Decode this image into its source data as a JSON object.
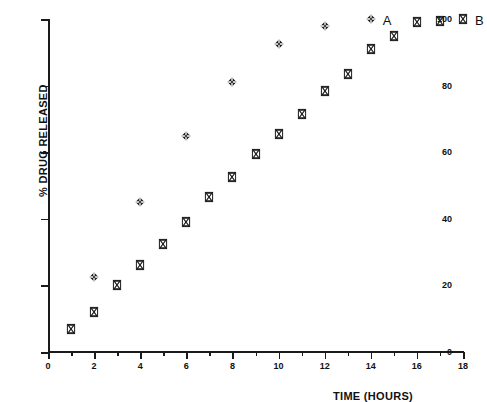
{
  "chart_data": {
    "type": "scatter",
    "title": "",
    "xlabel": "TIME (HOURS)",
    "ylabel": "% DRUG RELEASED",
    "xlim": [
      0,
      18
    ],
    "ylim": [
      0,
      100
    ],
    "x_ticks": [
      0,
      2,
      4,
      6,
      8,
      10,
      12,
      14,
      16,
      18
    ],
    "x_tick_labels": [
      "0",
      "2",
      "4",
      "6",
      "8",
      "10",
      "12",
      "14",
      "16",
      "18"
    ],
    "x_minor_ticks": [
      1,
      3,
      5,
      7,
      9,
      11,
      13,
      15,
      17
    ],
    "y_ticks": [
      0,
      20,
      40,
      60,
      80,
      100
    ],
    "y_tick_labels": [
      "0",
      "20",
      "40",
      "60",
      "80",
      "100"
    ],
    "y_minor_ticks": [
      10,
      30,
      50,
      70,
      90
    ],
    "grid": false,
    "legend_position": "inline-right-of-last-point",
    "series": [
      {
        "name": "A",
        "label": "A",
        "marker": "diamond-plus",
        "color": "#1a1a1a",
        "label_x": 14.0,
        "label_y": 100,
        "points": [
          {
            "x": 2,
            "y": 22.5
          },
          {
            "x": 4,
            "y": 45.0
          },
          {
            "x": 6,
            "y": 65.0
          },
          {
            "x": 8,
            "y": 81.0
          },
          {
            "x": 10,
            "y": 92.5
          },
          {
            "x": 12,
            "y": 98.0
          },
          {
            "x": 14,
            "y": 100.0
          }
        ]
      },
      {
        "name": "B",
        "label": "B",
        "marker": "hourglass",
        "color": "#1a1a1a",
        "label_x": 18.0,
        "label_y": 100,
        "points": [
          {
            "x": 1,
            "y": 7.0
          },
          {
            "x": 2,
            "y": 12.0
          },
          {
            "x": 3,
            "y": 20.0
          },
          {
            "x": 4,
            "y": 26.0
          },
          {
            "x": 5,
            "y": 32.5
          },
          {
            "x": 6,
            "y": 39.0
          },
          {
            "x": 7,
            "y": 46.5
          },
          {
            "x": 8,
            "y": 52.5
          },
          {
            "x": 9,
            "y": 59.5
          },
          {
            "x": 10,
            "y": 65.5
          },
          {
            "x": 11,
            "y": 71.5
          },
          {
            "x": 12,
            "y": 78.5
          },
          {
            "x": 13,
            "y": 83.5
          },
          {
            "x": 14,
            "y": 91.0
          },
          {
            "x": 15,
            "y": 95.0
          },
          {
            "x": 16,
            "y": 99.0
          },
          {
            "x": 17,
            "y": 99.5
          },
          {
            "x": 18,
            "y": 100.0
          }
        ]
      }
    ]
  }
}
